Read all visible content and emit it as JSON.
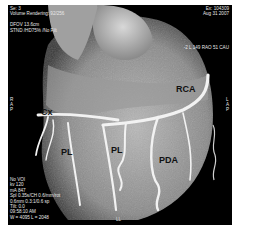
{
  "overlay": {
    "top_left": [
      "Se: 3",
      "Volume Rendering: 92/256",
      "",
      "DFOV 13.6cm",
      "STND /HD75% /No Filt"
    ],
    "top_right": [
      "Ex: 104309",
      "Aug 31 2007"
    ],
    "right_mid": "-2 L 149 RAO 51 CAU",
    "bottom_left": [
      "No VOI",
      "kv 120",
      "mA 847",
      "Spl 0.35s/CH 0.6/mm/rot",
      "0.6mm 0.3:1/0.6 sp",
      "Tilt: 0.0",
      "09:58:10 AM",
      "W = 4095 L = 2048"
    ],
    "left_orient": [
      "R",
      "",
      "A",
      "",
      "P"
    ],
    "right_orient": [
      "L",
      "",
      "A",
      "",
      "P"
    ],
    "bottom_center": "LL"
  },
  "labels": {
    "cx": "Cx",
    "rca": "RCA",
    "pl1": "PL",
    "pl2": "PL",
    "pda": "PDA"
  },
  "colors": {
    "background": "#000000",
    "frame_border": "#ffffff",
    "tissue_light": "#c8c8c8",
    "tissue_mid": "#8c8c8c",
    "vessel": "#f0f0f0"
  }
}
